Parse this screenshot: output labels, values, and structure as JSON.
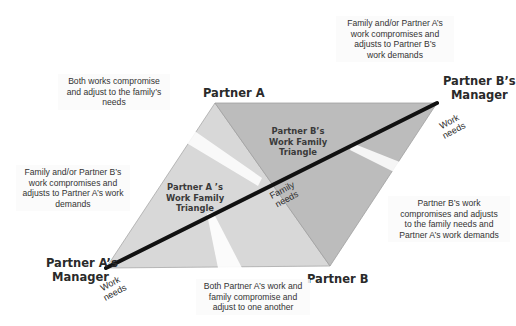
{
  "colors": {
    "light_triangle": "#d7d7d7",
    "dark_triangle": "#bdbdbd",
    "diagonal": "#111111",
    "edge": "#9a9a9a",
    "callout_text": "#333333",
    "label_text": "#2a2a2a"
  },
  "vertices": {
    "partner_a": {
      "label": "Partner A"
    },
    "partner_b": {
      "label": "Partner B"
    },
    "partner_a_manager": {
      "line1": "Partner A’s",
      "line2": "Manager"
    },
    "partner_b_manager": {
      "line1": "Partner B’s",
      "line2": "Manager"
    }
  },
  "triangles": {
    "partner_a": {
      "line1": "Partner A ’s",
      "line2": "Work Family",
      "line3": "Triangle"
    },
    "partner_b": {
      "line1": "Partner B’s",
      "line2": "Work Family",
      "line3": "Triangle"
    }
  },
  "axis_labels": {
    "work_needs_a": {
      "line1": "Work",
      "line2": "needs"
    },
    "work_needs_b": {
      "line1": "Work",
      "line2": "needs"
    },
    "family_needs": {
      "line1": "Family",
      "line2": "needs"
    }
  },
  "callouts": {
    "top_right": {
      "line1": "Family and/or Partner A’s",
      "line2": "work compromises and",
      "line3": "adjusts to Partner B’s",
      "line4": "work demands"
    },
    "top_left": {
      "line1": "Both works compromise",
      "line2": "and adjust to the family’s",
      "line3": "needs"
    },
    "left": {
      "line1": "Family and/or Partner B’s",
      "line2": "work compromises and",
      "line3": "adjusts to Partner A’s work",
      "line4": "demands"
    },
    "right": {
      "line1": "Partner B’s work",
      "line2": "compromises and adjusts",
      "line3": "to the family needs and",
      "line4": "Partner A’s work demands"
    },
    "bottom": {
      "line1": "Both Partner A’s work and",
      "line2": "family compromise and",
      "line3": "adjust to one another"
    }
  }
}
